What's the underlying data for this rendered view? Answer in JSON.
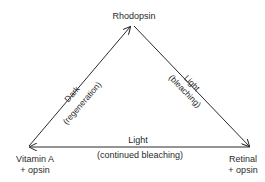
{
  "diagram": {
    "nodes": {
      "top": {
        "label": "Rhodopsin"
      },
      "left": {
        "label": "Vitamin A",
        "sublabel": "+ opsin"
      },
      "right": {
        "label": "Retinal",
        "sublabel": "+ opsin"
      }
    },
    "edges": {
      "left_up": {
        "condition": "Dark",
        "process": "(regeneration)",
        "from": "Vitamin A + opsin",
        "to": "Rhodopsin"
      },
      "right_down": {
        "condition": "Light",
        "process": "(bleaching)",
        "from": "Rhodopsin",
        "to": "Retinal + opsin"
      },
      "bottom": {
        "condition": "Light",
        "process": "(continued bleaching)",
        "from": "Retinal + opsin",
        "to": "Vitamin A + opsin"
      }
    },
    "colors": {
      "line": "#2a2a2a",
      "text": "#2a2a2a",
      "background": "#ffffff"
    }
  }
}
